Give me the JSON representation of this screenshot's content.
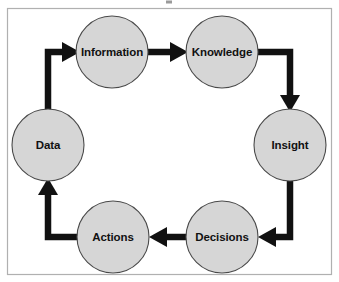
{
  "diagram": {
    "title": "",
    "type": "cycle",
    "background_color": "#ffffff",
    "frame_color": "#b0b0b0",
    "node_fill_color": "#d6d6d6",
    "node_stroke_color": "#4a4a4a",
    "arrow_color": "#111111",
    "label_color": "#111111",
    "nodes": [
      {
        "id": "data",
        "label": "Data",
        "cx": 48,
        "cy": 145,
        "r": 36
      },
      {
        "id": "information",
        "label": "Information",
        "cx": 112,
        "cy": 52,
        "r": 36
      },
      {
        "id": "knowledge",
        "label": "Knowledge",
        "cx": 222,
        "cy": 52,
        "r": 36
      },
      {
        "id": "insight",
        "label": "Insight",
        "cx": 290,
        "cy": 145,
        "r": 36
      },
      {
        "id": "decisions",
        "label": "Decisions",
        "cx": 222,
        "cy": 237,
        "r": 36
      },
      {
        "id": "actions",
        "label": "Actions",
        "cx": 113,
        "cy": 237,
        "r": 36
      }
    ],
    "edges": [
      {
        "id": "data-to-information",
        "from": "Data",
        "to": "Information",
        "shape": "elbow-up-right"
      },
      {
        "id": "information-to-knowledge",
        "from": "Information",
        "to": "Knowledge",
        "shape": "straight-right"
      },
      {
        "id": "knowledge-to-insight",
        "from": "Knowledge",
        "to": "Insight",
        "shape": "elbow-right-down"
      },
      {
        "id": "insight-to-decisions",
        "from": "Insight",
        "to": "Decisions",
        "shape": "elbow-down-left"
      },
      {
        "id": "decisions-to-actions",
        "from": "Decisions",
        "to": "Actions",
        "shape": "straight-left"
      },
      {
        "id": "actions-to-data",
        "from": "Actions",
        "to": "Data",
        "shape": "elbow-left-up"
      }
    ]
  }
}
